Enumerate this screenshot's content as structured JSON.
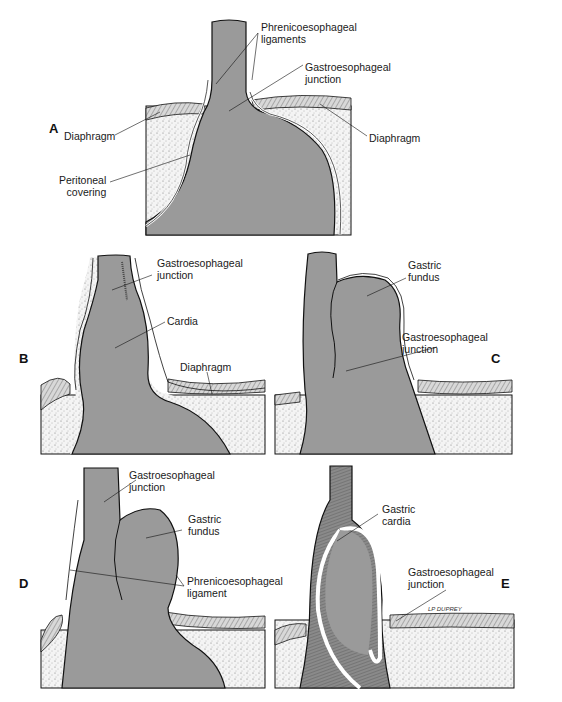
{
  "figure": {
    "colors": {
      "organ": "#9a9a9a",
      "diaphragm_fill": "#f2f2f2",
      "outline": "#111111",
      "background": "#ffffff"
    },
    "panels": [
      {
        "id": "A",
        "letter": "A",
        "labels": [
          {
            "text": "Phrenicoesophageal\nligaments"
          },
          {
            "text": "Gastroesophageal\njunction"
          },
          {
            "text": "Diaphragm"
          },
          {
            "text": "Diaphragm"
          },
          {
            "text": "Peritoneal\ncovering"
          }
        ]
      },
      {
        "id": "B",
        "letter": "B",
        "labels": [
          {
            "text": "Gastroesophageal\njunction"
          },
          {
            "text": "Cardia"
          },
          {
            "text": "Diaphragm"
          }
        ]
      },
      {
        "id": "C",
        "letter": "C",
        "labels": [
          {
            "text": "Gastric\nfundus"
          },
          {
            "text": "Gastroesophageal\njunction"
          }
        ]
      },
      {
        "id": "D",
        "letter": "D",
        "labels": [
          {
            "text": "Gastroesophageal\njunction"
          },
          {
            "text": "Gastric\nfundus"
          },
          {
            "text": "Phrenicoesophageal\nligament"
          }
        ]
      },
      {
        "id": "E",
        "letter": "E",
        "labels": [
          {
            "text": "Gastric\ncardia"
          },
          {
            "text": "Gastroesophageal\njunction"
          }
        ],
        "signature": "LP DUPREY"
      }
    ]
  }
}
